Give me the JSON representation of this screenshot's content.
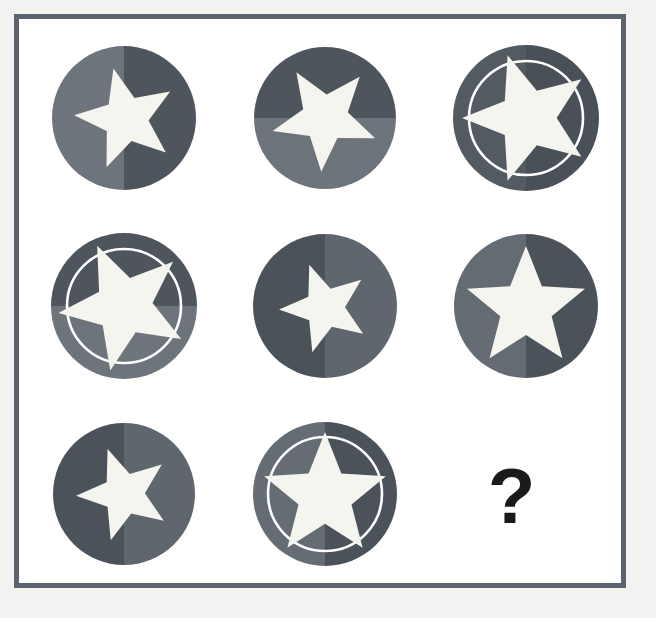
{
  "puzzle": {
    "type": "visual-analogy-matrix",
    "title": "3x3 star token matrix reasoning puzzle",
    "rows": 3,
    "columns": 3,
    "background_color": "#f2f2f0",
    "panel_color": "#ffffff",
    "frame_color": "#5b646e",
    "star_color": "#f5f5f0",
    "ring_color": "#ffffff",
    "question_mark": "?",
    "question_mark_color": "#1a1a1a",
    "cells": [
      {
        "index": 1,
        "position": "top-left",
        "name": "cell-1",
        "circle_radius": 72,
        "split": "vertical",
        "color_a": "#6d747c",
        "color_b": "#4f555d",
        "has_ring": false,
        "ring_radius": 0,
        "star_size": 52,
        "star_rotation": -14,
        "star_offset_x": 2,
        "star_offset_y": 1,
        "is_answer_slot": false
      },
      {
        "index": 2,
        "position": "top-center",
        "name": "cell-2",
        "circle_radius": 71,
        "split": "horizontal",
        "color_a": "#4f555d",
        "color_b": "#6d747c",
        "has_ring": false,
        "ring_radius": 0,
        "star_size": 54,
        "star_rotation": -32,
        "star_offset_x": 0,
        "star_offset_y": 0,
        "is_answer_slot": false
      },
      {
        "index": 3,
        "position": "top-right",
        "name": "cell-3",
        "circle_radius": 73,
        "split": "vertical",
        "color_a": "#545a62",
        "color_b": "#4a5057",
        "has_ring": true,
        "ring_radius": 57,
        "star_size": 66,
        "star_rotation": -18,
        "star_offset_x": 2,
        "star_offset_y": 0,
        "is_answer_slot": false
      },
      {
        "index": 4,
        "position": "middle-left",
        "name": "cell-4",
        "circle_radius": 73,
        "split": "horizontal",
        "color_a": "#4f555d",
        "color_b": "#6d747c",
        "has_ring": true,
        "ring_radius": 57,
        "star_size": 66,
        "star_rotation": -24,
        "star_offset_x": 0,
        "star_offset_y": 0,
        "is_answer_slot": false
      },
      {
        "index": 5,
        "position": "middle-center",
        "name": "cell-5",
        "circle_radius": 72,
        "split": "vertical",
        "color_a": "#4c525a",
        "color_b": "#5f666e",
        "has_ring": false,
        "ring_radius": 0,
        "star_size": 46,
        "star_rotation": -20,
        "star_offset_x": 0,
        "star_offset_y": 2,
        "is_answer_slot": false
      },
      {
        "index": 6,
        "position": "middle-right",
        "name": "cell-6",
        "circle_radius": 72,
        "split": "vertical",
        "color_a": "#646b73",
        "color_b": "#4c525a",
        "has_ring": false,
        "ring_radius": 0,
        "star_size": 62,
        "star_rotation": 0,
        "star_offset_x": 0,
        "star_offset_y": 2,
        "is_answer_slot": false
      },
      {
        "index": 7,
        "position": "bottom-left",
        "name": "cell-7",
        "circle_radius": 71,
        "split": "vertical",
        "color_a": "#4c525a",
        "color_b": "#5f666e",
        "has_ring": false,
        "ring_radius": 0,
        "star_size": 48,
        "star_rotation": -20,
        "star_offset_x": 0,
        "star_offset_y": 0,
        "is_answer_slot": false
      },
      {
        "index": 8,
        "position": "bottom-center",
        "name": "cell-8",
        "circle_radius": 72,
        "split": "vertical",
        "color_a": "#656c74",
        "color_b": "#4c525a",
        "has_ring": true,
        "ring_radius": 57,
        "star_size": 64,
        "star_rotation": 0,
        "star_offset_x": 0,
        "star_offset_y": 2,
        "is_answer_slot": false
      },
      {
        "index": 9,
        "position": "bottom-right",
        "name": "cell-9",
        "circle_radius": 0,
        "split": "none",
        "color_a": "",
        "color_b": "",
        "has_ring": false,
        "ring_radius": 0,
        "star_size": 0,
        "star_rotation": 0,
        "star_offset_x": 0,
        "star_offset_y": 0,
        "is_answer_slot": true
      }
    ]
  }
}
